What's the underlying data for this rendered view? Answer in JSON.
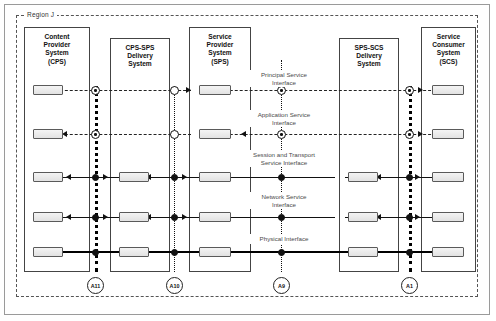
{
  "diagram": {
    "region_label": "Region J",
    "systems": [
      {
        "id": "cps",
        "lines": [
          "Content",
          "Provider",
          "System",
          "(CPS)"
        ]
      },
      {
        "id": "cps-sps",
        "lines": [
          "CPS-SPS",
          "Delivery",
          "System"
        ]
      },
      {
        "id": "sps",
        "lines": [
          "Service",
          "Provider",
          "System",
          "(SPS)"
        ]
      },
      {
        "id": "sps-scs",
        "lines": [
          "SPS-SCS",
          "Delivery",
          "System"
        ]
      },
      {
        "id": "scs",
        "lines": [
          "Service",
          "Consumer",
          "System",
          "(SCS)"
        ]
      }
    ],
    "interfaces": [
      {
        "id": "principal",
        "lines": [
          "Principal Service",
          "Interface"
        ]
      },
      {
        "id": "application",
        "lines": [
          "Application Service",
          "Interface"
        ]
      },
      {
        "id": "session",
        "lines": [
          "Session and Transport",
          "Service Interface"
        ]
      },
      {
        "id": "network",
        "lines": [
          "Network Service",
          "Interface"
        ]
      },
      {
        "id": "physical",
        "lines": [
          "Physical Interface"
        ]
      }
    ],
    "reference_points": [
      {
        "id": "a11",
        "label": "A11"
      },
      {
        "id": "a10",
        "label": "A10"
      },
      {
        "id": "a9",
        "label": "A9"
      },
      {
        "id": "a1",
        "label": "A1"
      }
    ],
    "colors": {
      "line": "#111111",
      "chip_fill": "#e9e9e9",
      "chip_border": "#5a5a5a",
      "region_border": "#555555",
      "caption": "#4a4a4a"
    }
  }
}
